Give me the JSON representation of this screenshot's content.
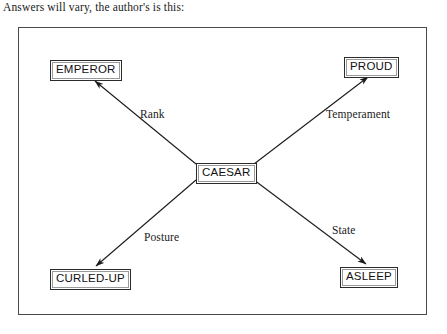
{
  "caption": "Answers will vary, the author's is this:",
  "diagram": {
    "type": "concept-map",
    "center_node": "CAESAR",
    "nodes": [
      {
        "id": "caesar",
        "label": "CAESAR",
        "role": "center"
      },
      {
        "id": "emperor",
        "label": "EMPEROR",
        "role": "leaf"
      },
      {
        "id": "proud",
        "label": "PROUD",
        "role": "leaf"
      },
      {
        "id": "curled-up",
        "label": "CURLED-UP",
        "role": "leaf"
      },
      {
        "id": "asleep",
        "label": "ASLEEP",
        "role": "leaf"
      }
    ],
    "edges": [
      {
        "from": "CAESAR",
        "to": "EMPEROR",
        "label": "Rank",
        "direction": "up-left"
      },
      {
        "from": "CAESAR",
        "to": "PROUD",
        "label": "Temperament",
        "direction": "up-right"
      },
      {
        "from": "CAESAR",
        "to": "CURLED-UP",
        "label": "Posture",
        "direction": "down-left"
      },
      {
        "from": "CAESAR",
        "to": "ASLEEP",
        "label": "State",
        "direction": "down-right"
      }
    ],
    "colors": {
      "frame_border": "#4a4a4a",
      "node_border": "#2b2b2b",
      "edge_line": "#1a1a1a",
      "text": "#111111",
      "background": "#ffffff"
    }
  }
}
